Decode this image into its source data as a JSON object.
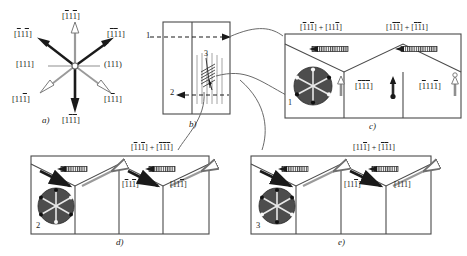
{
  "figure": {
    "type": "crystallographic-twin-schematic",
    "background": "#ffffff",
    "ink": "#1a1a1a",
    "gray": "#8d8d8d",
    "dark_circle_fill": "#4a4a4a",
    "width": 467,
    "height": 256
  },
  "panel_a": {
    "caption": "a)",
    "description": "star of six slip-direction vectors radiating from a central origin node",
    "vectors": [
      {
        "id": "up",
        "label": "[̄1̄1̄1]",
        "label_html": "[<u>1</u>1<u>1</u>]",
        "style": "open-outline-gray",
        "direction": "north",
        "label_pos": "above"
      },
      {
        "id": "upper-right",
        "label": "[̄1̄1 1]",
        "label_html": "[<u>1</u><u>1</u>1]",
        "style": "solid-black",
        "direction": "northeast",
        "label_pos": "upper-right"
      },
      {
        "id": "upper-left",
        "label": "[̄1 1̄1]",
        "label_html": "[<u>1</u>1<u>1</u>]",
        "style": "solid-black",
        "direction": "northwest",
        "label_pos": "upper-left"
      },
      {
        "id": "left",
        "label": "[111]",
        "label_html": "[111]",
        "style": "thin-gray-line",
        "direction": "west",
        "label_pos": "left"
      },
      {
        "id": "right",
        "label": "(111)",
        "label_html": "(111)",
        "style": "thin-gray-line",
        "direction": "east",
        "label_pos": "right"
      },
      {
        "id": "lower-left",
        "label": "[11̄1]",
        "label_html": "[11<u>1</u>]",
        "style": "open-outline-gray",
        "direction": "southwest",
        "label_pos": "lower-left"
      },
      {
        "id": "lower-right",
        "label": "[1̄1 1]",
        "label_html": "[1<u>1</u>1]",
        "style": "open-outline-gray",
        "direction": "southeast",
        "label_pos": "lower-right"
      },
      {
        "id": "down",
        "label": "[1̄1̄1]",
        "label_html": "[1<u>1</u><u>1</u>]",
        "style": "solid-black",
        "direction": "south",
        "label_pos": "below"
      }
    ],
    "origin_marker": "small-open-circle"
  },
  "panel_b": {
    "caption": "b)",
    "description": "rectangular specimen cross-section with vertical grain boundary, two horizontal dashed section lines and a hatched slip-band region",
    "markers": [
      {
        "id": "1",
        "label": "1",
        "type": "section-line",
        "position": "upper-left",
        "line": "dashed-horizontal"
      },
      {
        "id": "2",
        "label": "2",
        "type": "section-line",
        "position": "lower-mid",
        "line": "dashed-horizontal"
      },
      {
        "id": "3",
        "label": "3",
        "type": "slip-band",
        "position": "center",
        "line": "hatched-band"
      }
    ],
    "features": [
      "vertical-boundary-line",
      "vertical-striation-lines",
      "hatched-shear-zone"
    ]
  },
  "panel_c": {
    "caption": "c)",
    "description": "three-cell zigzag twin band, leftmost cell carries pole-figure disc labelled 1",
    "top_labels": [
      {
        "id": "c-top-left",
        "label": "[̄1 1 1̄] + [1 1 ̄1]",
        "label_html": "[<u>1</u>1<u>1</u>] + [11<u>1</u>]"
      },
      {
        "id": "c-top-right",
        "label": "[1̄1 ̄1 1] + [̄1 ̄1 1]",
        "label_html": "[1<u>1</u><u>1</u>] + [<u>1</u><u>1</u>1]"
      }
    ],
    "cells": [
      {
        "id": "c-cell-1",
        "disc": {
          "label": "1",
          "fill": "dark",
          "spokes": 6
        },
        "arrow": "open-up",
        "label": "",
        "label_html": ""
      },
      {
        "id": "c-cell-2",
        "disc": null,
        "arrow": "solid-down",
        "label": "[̄1 ̄1 ̄1]",
        "label_html": "[<u>1</u><u>1</u><u>1</u>]"
      },
      {
        "id": "c-cell-3",
        "disc": null,
        "arrow": "open-up",
        "label": "[̄1 1 1 1]",
        "label_html": "[<u>1</u>11<u>1</u>]"
      }
    ],
    "boundary_symbols": [
      "hatched-bar-left-arrow",
      "hatched-bar-right-arrow"
    ]
  },
  "panel_d": {
    "caption": "d)",
    "description": "four-cell zigzag twin band, leftmost cell carries pole-figure disc labelled 2",
    "top_labels": [
      {
        "id": "d-top-right",
        "label": "[̄1 1 1̄] + [̄1 1̄ 1̄]",
        "label_html": "[<u>1</u>1<u>1</u>] + [<u>1</u><u>1</u><u>1</u>]"
      }
    ],
    "cells": [
      {
        "id": "d-cell-1",
        "disc": {
          "label": "2",
          "fill": "dark",
          "spokes": 6
        },
        "arrow": "solid-black-left",
        "label": "",
        "label_html": ""
      },
      {
        "id": "d-cell-2",
        "disc": null,
        "arrow": "open-outline-right",
        "label": "",
        "label_html": ""
      },
      {
        "id": "d-cell-3",
        "disc": null,
        "arrow": "solid-black-right",
        "label": "[̄1 1̄ 1̄]",
        "label_html": "[<u>1</u>1<u>1</u>]"
      },
      {
        "id": "d-cell-4",
        "disc": null,
        "arrow": "open-outline-right",
        "label": "[1 1 1̄]",
        "label_html": "[11<u>1</u>]"
      }
    ],
    "boundary_symbols": [
      "hatched-bar-left-arrow",
      "hatched-bar-left-arrow"
    ]
  },
  "panel_e": {
    "caption": "e)",
    "description": "four-cell zigzag twin band, leftmost cell carries pole-figure disc labelled 3",
    "top_labels": [
      {
        "id": "e-top-right",
        "label": "[1 1 1̄] + [̄1 1̄ 1]",
        "label_html": "[11<u>1</u>] + [<u>1</u><u>1</u>1]"
      }
    ],
    "cells": [
      {
        "id": "e-cell-1",
        "disc": {
          "label": "3",
          "fill": "dark",
          "spokes": 6
        },
        "arrow": "solid-black-left",
        "label": "",
        "label_html": ""
      },
      {
        "id": "e-cell-2",
        "disc": null,
        "arrow": "open-outline-right",
        "label": "",
        "label_html": ""
      },
      {
        "id": "e-cell-3",
        "disc": null,
        "arrow": "solid-black-right",
        "label": "[1 1 1̄]",
        "label_html": "[11<u>1</u>]"
      },
      {
        "id": "e-cell-4",
        "disc": null,
        "arrow": "open-outline-right",
        "label": "[1 1 1]",
        "label_html": "[111]"
      }
    ],
    "boundary_symbols": [
      "hatched-bar-left-arrow",
      "hatched-bar-left-arrow"
    ]
  },
  "connectors": [
    {
      "id": "connector-1",
      "from": "panel_b.marker.1",
      "to": "panel_c",
      "style": "curved-thin-line"
    },
    {
      "id": "connector-2",
      "from": "panel_b.marker.3",
      "to": "panel_e",
      "style": "curved-thin-line"
    },
    {
      "id": "connector-3",
      "from": "panel_b.marker.2",
      "to": "panel_d",
      "style": "curved-thin-line"
    }
  ]
}
